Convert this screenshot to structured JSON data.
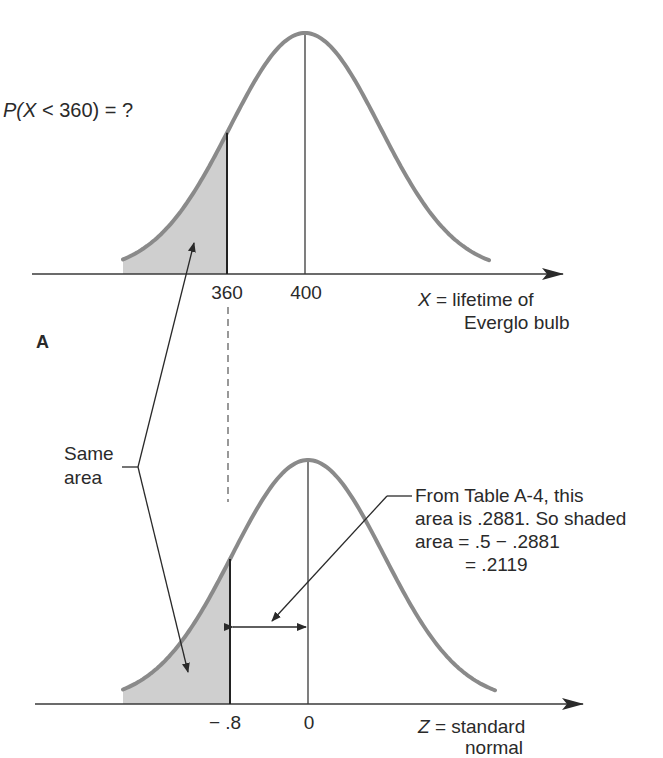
{
  "figure": {
    "panel_label": "A",
    "top_plot": {
      "question": {
        "prefix": "P(",
        "var": "X",
        "rest": " < 360)  =  ?"
      },
      "ticks": [
        {
          "label": "360",
          "x": 360
        },
        {
          "label": "400",
          "x": 400
        }
      ],
      "axis_label": {
        "var": "X",
        "eq": " =  lifetime of",
        "line2": "Everglo bulb"
      },
      "mean": 400,
      "cutoff": 360,
      "shaded": "left of 360"
    },
    "bottom_plot": {
      "ticks": [
        {
          "label": "− .8",
          "z": -0.8
        },
        {
          "label": "0",
          "z": 0
        }
      ],
      "axis_label": {
        "var": "Z",
        "eq": " =  standard",
        "line2": "normal"
      },
      "mean": 0,
      "cutoff": -0.8,
      "shaded": "left of -.8"
    },
    "same_area_label": {
      "line1": "Same",
      "line2": "area"
    },
    "annotation": {
      "line1": "From Table A-4, this",
      "line2": "area is .2881. So shaded",
      "line3": "area  =  .5 −  .2881",
      "line4": "=  .2119"
    },
    "colors": {
      "curve": "#8a8a8a",
      "shade": "#cfcfcf",
      "axis": "#3a3a3a",
      "text": "#2a2a2a"
    }
  }
}
